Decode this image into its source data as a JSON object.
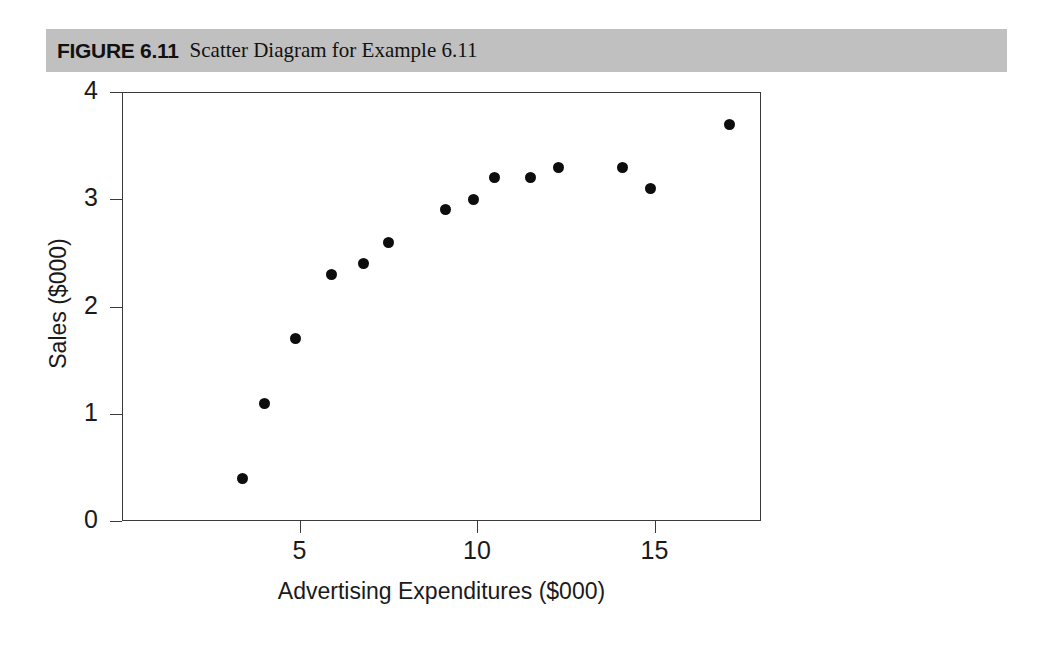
{
  "caption": {
    "figure_number": "FIGURE 6.11",
    "title": "Scatter Diagram for Example 6.11"
  },
  "chart_data": {
    "type": "scatter",
    "title": "Scatter Diagram for Example 6.11",
    "xlabel": "Advertising Expenditures ($000)",
    "ylabel": "Sales ($000)",
    "xlim": [
      0,
      18
    ],
    "ylim": [
      0,
      4
    ],
    "xticks": [
      5,
      10,
      15
    ],
    "yticks": [
      0,
      1,
      2,
      3,
      4
    ],
    "grid": false,
    "legend": null,
    "marker": {
      "shape": "circle",
      "color": "#0d0d0d",
      "size": 11
    },
    "points": [
      {
        "x": 3.4,
        "y": 0.4
      },
      {
        "x": 4.0,
        "y": 1.1
      },
      {
        "x": 4.9,
        "y": 1.7
      },
      {
        "x": 5.9,
        "y": 2.3
      },
      {
        "x": 6.8,
        "y": 2.4
      },
      {
        "x": 7.5,
        "y": 2.6
      },
      {
        "x": 9.1,
        "y": 2.9
      },
      {
        "x": 9.9,
        "y": 3.0
      },
      {
        "x": 10.5,
        "y": 3.2
      },
      {
        "x": 11.5,
        "y": 3.2
      },
      {
        "x": 12.3,
        "y": 3.3
      },
      {
        "x": 14.1,
        "y": 3.3
      },
      {
        "x": 14.9,
        "y": 3.1
      },
      {
        "x": 17.1,
        "y": 3.7
      }
    ]
  },
  "colors": {
    "caption_bar": "#c0c0c0",
    "axis": "#3a3a3a",
    "marker": "#0d0d0d",
    "text": "#1a1a1a",
    "background": "#ffffff"
  }
}
